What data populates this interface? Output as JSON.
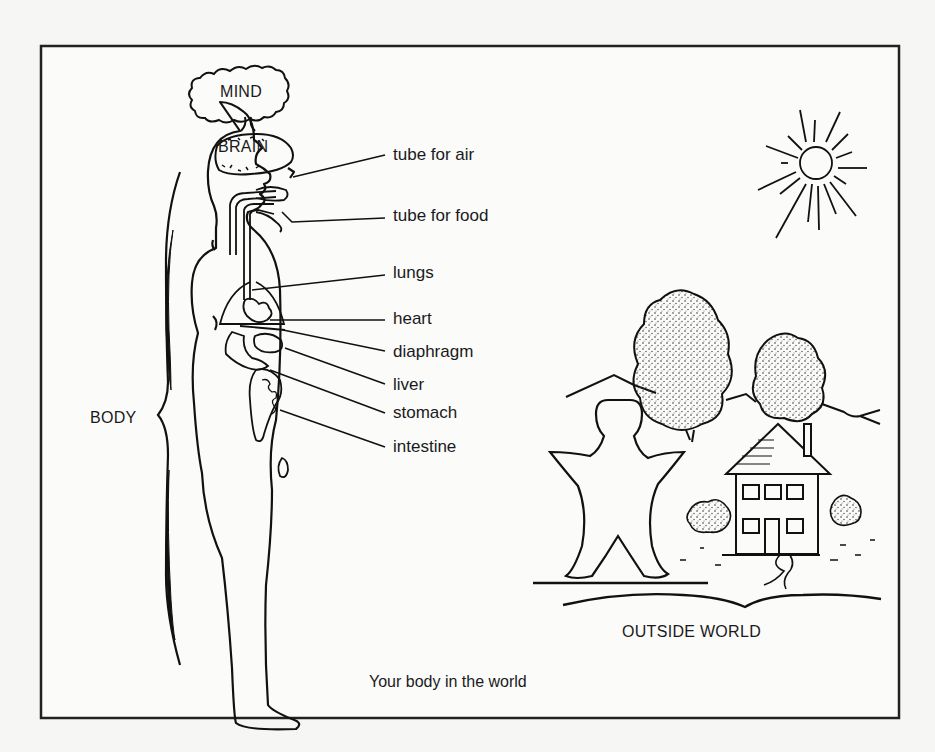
{
  "figure": {
    "caption": "Your body in the world",
    "frame_color": "#222222",
    "background": "#f6f6f4"
  },
  "labels": {
    "mind": "MIND",
    "brain": "BRAIN",
    "body": "BODY",
    "outside_world": "OUTSIDE WORLD"
  },
  "organs": [
    {
      "id": "tube-for-air",
      "label": "tube for air"
    },
    {
      "id": "tube-for-food",
      "label": "tube for food"
    },
    {
      "id": "lungs",
      "label": "lungs"
    },
    {
      "id": "heart",
      "label": "heart"
    },
    {
      "id": "diaphragm",
      "label": "diaphragm"
    },
    {
      "id": "liver",
      "label": "liver"
    },
    {
      "id": "stomach",
      "label": "stomach"
    },
    {
      "id": "intestine",
      "label": "intestine"
    }
  ],
  "scene_elements": [
    "sun",
    "mountains",
    "tree-large",
    "tree-small",
    "house",
    "bushes",
    "person-figure",
    "path",
    "ground-line"
  ]
}
